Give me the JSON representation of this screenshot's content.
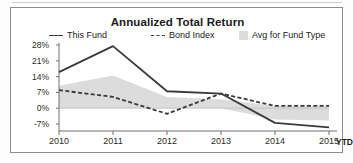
{
  "card": {
    "title": "Annualized Total Return"
  },
  "legend": {
    "items": [
      {
        "label": "This Fund",
        "style": "solid-line",
        "color": "#3a3a3a"
      },
      {
        "label": "Bond Index",
        "style": "dashed-line",
        "color": "#3a3a3a"
      },
      {
        "label": "Avg for Fund Type",
        "style": "filled-area",
        "color": "#dcdcdc"
      }
    ]
  },
  "axis": {
    "y_ticks": [
      "28%",
      "21%",
      "14%",
      "7%",
      "0%",
      "-7%"
    ],
    "x_ticks": [
      "2010",
      "2011",
      "2012",
      "2013",
      "2014",
      "2015"
    ],
    "x_suffix": "YTD"
  },
  "chart_data": {
    "type": "line",
    "title": "Annualized Total Return",
    "xlabel": "",
    "ylabel": "",
    "categories": [
      "2010",
      "2011",
      "2012",
      "2013",
      "2014",
      "2015"
    ],
    "x_axis_note": "YTD",
    "ylim": [
      -10,
      30
    ],
    "ytick_values": [
      28,
      21,
      14,
      7,
      0,
      -7
    ],
    "grid": false,
    "legend_position": "top",
    "units": "percent",
    "series": [
      {
        "name": "This Fund",
        "style": "solid",
        "color": "#3a3a3a",
        "values": [
          16.0,
          27.5,
          7.5,
          6.5,
          -6.5,
          -8.5
        ]
      },
      {
        "name": "Bond Index",
        "style": "dashed",
        "color": "#3a3a3a",
        "values": [
          8.0,
          5.0,
          -2.5,
          6.5,
          1.0,
          1.0
        ]
      }
    ],
    "band": {
      "name": "Avg for Fund Type",
      "type": "area",
      "color": "#dcdcdc",
      "upper": [
        10.0,
        14.5,
        5.0,
        4.0,
        1.0,
        1.0
      ],
      "lower": [
        0.0,
        0.0,
        0.0,
        0.0,
        -5.0,
        -5.5
      ]
    }
  }
}
